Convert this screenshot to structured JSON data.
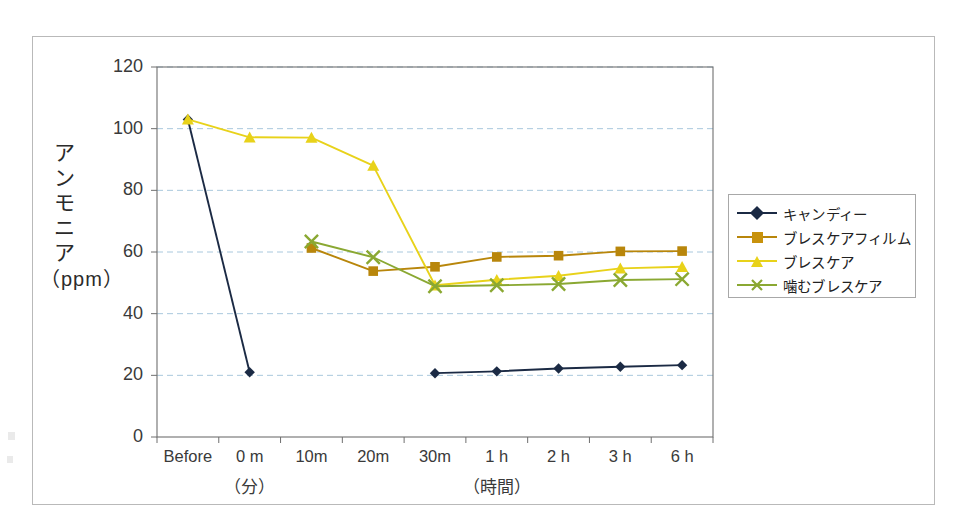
{
  "chart_data": {
    "type": "line",
    "title": "",
    "xlabel": "",
    "ylabel": "アンモニア（ppm）",
    "categories": [
      "Before",
      "0 m",
      "10m",
      "20m",
      "30m",
      "1 h",
      "2 h",
      "3 h",
      "6 h"
    ],
    "x_group_labels": [
      {
        "text": "（分）",
        "under": "0 m"
      },
      {
        "text": "（時間）",
        "under": "1 h"
      }
    ],
    "ylim": [
      0,
      120
    ],
    "ytick_step": 20,
    "yticks": [
      "0",
      "20",
      "40",
      "60",
      "80",
      "100",
      "120"
    ],
    "grid": "horizontal-dashed",
    "legend_position": "right",
    "series": [
      {
        "name": "キャンディー",
        "color": "#1b2a44",
        "marker": "diamond",
        "values": [
          103.0,
          21.0,
          null,
          null,
          20.7,
          21.3,
          22.2,
          22.8,
          23.3
        ]
      },
      {
        "name": "ブレスケアフィルム",
        "color": "#b8860b",
        "marker": "square",
        "values": [
          null,
          null,
          61.3,
          53.8,
          55.2,
          58.4,
          58.8,
          60.2,
          60.3
        ]
      },
      {
        "name": "ブレスケア",
        "color": "#e8d21a",
        "marker": "triangle",
        "values": [
          103.0,
          97.2,
          97.1,
          88.0,
          49.2,
          51.0,
          52.3,
          54.7,
          55.2
        ]
      },
      {
        "name": "噛むブレスケア",
        "color": "#8aa832",
        "marker": "cross",
        "values": [
          null,
          null,
          63.4,
          58.3,
          48.9,
          49.2,
          49.6,
          50.9,
          51.2
        ]
      }
    ]
  },
  "axis": {
    "y_title_chars": [
      "ア",
      "ン",
      "モ",
      "ニ",
      "ア"
    ],
    "y_title_unit": "（ppm）"
  },
  "legend": {
    "items": [
      {
        "label": "キャンディー",
        "color": "#1b2a44",
        "marker": "diamond"
      },
      {
        "label": "ブレスケアフィルム",
        "color": "#b8860b",
        "marker": "square"
      },
      {
        "label": "ブレスケア",
        "color": "#e8d21a",
        "marker": "triangle"
      },
      {
        "label": "噛むブレスケア",
        "color": "#8aa832",
        "marker": "cross"
      }
    ]
  }
}
